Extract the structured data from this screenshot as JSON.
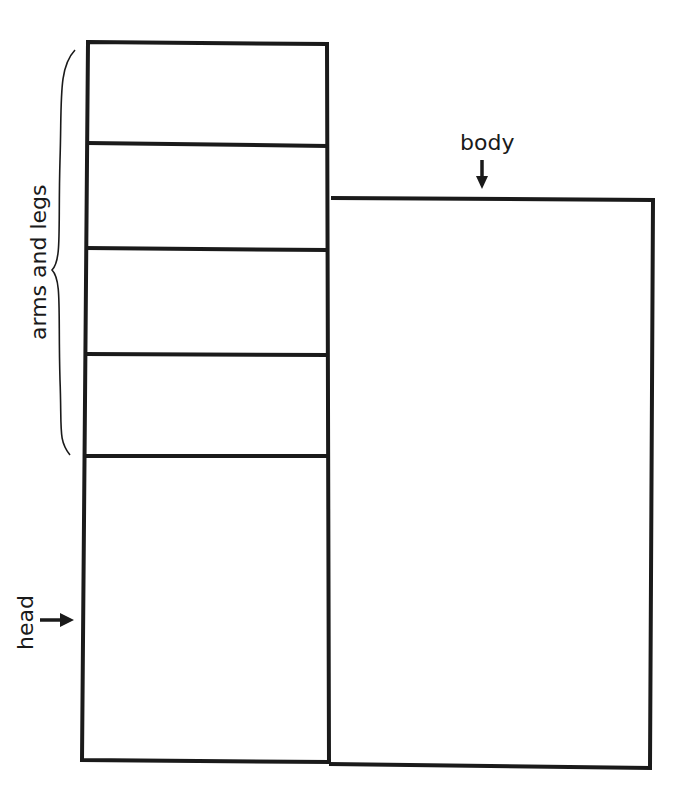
{
  "diagram": {
    "background": "#ffffff",
    "stroke_color": "#1a1a1a",
    "labels": {
      "arms_and_legs": "arms and legs",
      "body": "body",
      "head": "head"
    },
    "left_column": {
      "x": 84,
      "x2": 329,
      "top": 44,
      "bottom": 762,
      "dividers_y": [
        144,
        248,
        355,
        456
      ],
      "segments": [
        {
          "name": "arms-and-legs-section-1"
        },
        {
          "name": "arms-and-legs-section-2"
        },
        {
          "name": "arms-and-legs-section-3"
        },
        {
          "name": "arms-and-legs-section-4"
        },
        {
          "name": "head-section"
        }
      ]
    },
    "body_rect": {
      "x": 329,
      "x2": 652,
      "top": 198,
      "bottom": 768
    }
  }
}
